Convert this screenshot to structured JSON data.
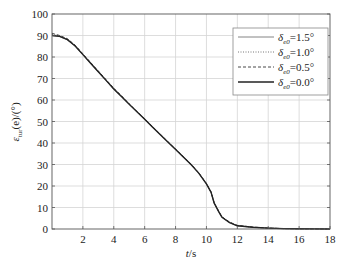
{
  "chart_data": {
    "type": "line",
    "title": "",
    "xlabel": "t/s",
    "xlabel_italic_part": "t",
    "xlabel_rest": "/s",
    "ylabel": "ε_tur(e)/(°)",
    "ylabel_main": "ε",
    "ylabel_sub": "tur",
    "ylabel_rest": "(e)/(°)",
    "xlim": [
      0,
      18
    ],
    "ylim": [
      0,
      100
    ],
    "xticks": [
      2,
      4,
      6,
      8,
      10,
      12,
      14,
      16,
      18
    ],
    "yticks": [
      0,
      10,
      20,
      30,
      40,
      50,
      60,
      70,
      80,
      90,
      100
    ],
    "grid": true,
    "legend_position": "upper right",
    "x": [
      0,
      0.5,
      1,
      1.5,
      2,
      2.5,
      3,
      3.5,
      4,
      4.5,
      5,
      5.5,
      6,
      6.5,
      7,
      7.5,
      8,
      8.5,
      9,
      9.5,
      10,
      10.3,
      10.5,
      10.8,
      11,
      11.5,
      12,
      13,
      14,
      15,
      16,
      17,
      18
    ],
    "series": [
      {
        "name": "δe0=1.5°",
        "label_main": "δ",
        "label_sub": "e0",
        "label_value": "=1.5°",
        "style": "solid-thin",
        "color": "#777777",
        "values": [
          90,
          89.5,
          88,
          85,
          81,
          77,
          73,
          69,
          65,
          61.5,
          58,
          54.5,
          51,
          47.5,
          44,
          40.5,
          37,
          33.5,
          30,
          26,
          21,
          17,
          12,
          8,
          5.5,
          3,
          1.5,
          0.8,
          0.4,
          0.2,
          0.1,
          0.05,
          0
        ]
      },
      {
        "name": "δe0=1.0°",
        "label_main": "δ",
        "label_sub": "e0",
        "label_value": "=1.0°",
        "style": "dotted",
        "color": "#666666",
        "values": [
          90.5,
          89.8,
          88.3,
          85.2,
          81.3,
          77.2,
          73.2,
          69.2,
          65.3,
          61.7,
          58.1,
          54.6,
          51.1,
          47.6,
          44.1,
          40.6,
          37.1,
          33.6,
          30.1,
          26.1,
          21.1,
          17.1,
          12.1,
          8.1,
          5.6,
          3.1,
          1.6,
          0.8,
          0.4,
          0.2,
          0.1,
          0.05,
          0
        ]
      },
      {
        "name": "δe0=0.5°",
        "label_main": "δ",
        "label_sub": "e0",
        "label_value": "=0.5°",
        "style": "dashed",
        "color": "#333333",
        "values": [
          91,
          90,
          88.5,
          85.5,
          81.5,
          77.5,
          73.5,
          69.5,
          65.5,
          62,
          58.2,
          54.7,
          51.2,
          47.7,
          44.2,
          40.7,
          37.2,
          33.7,
          30.2,
          26.2,
          21.2,
          17.2,
          12.2,
          8.2,
          5.7,
          3.2,
          1.7,
          0.9,
          0.4,
          0.2,
          0.1,
          0.05,
          0
        ]
      },
      {
        "name": "δe0=0.0°",
        "label_main": "δ",
        "label_sub": "e0",
        "label_value": "=0.0°",
        "style": "solid-thick",
        "color": "#222222",
        "values": [
          90,
          89.6,
          88.1,
          85.1,
          81.1,
          77.1,
          73.1,
          69.1,
          65.1,
          61.6,
          58,
          54.5,
          51,
          47.5,
          44,
          40.5,
          37,
          33.5,
          30,
          26,
          21,
          17,
          12,
          8,
          5.5,
          3,
          1.5,
          0.8,
          0.4,
          0.2,
          0.1,
          0.05,
          0
        ]
      }
    ]
  },
  "colors": {
    "axis": "#555555",
    "grid": "#d4d4d4",
    "background": "#ffffff"
  }
}
